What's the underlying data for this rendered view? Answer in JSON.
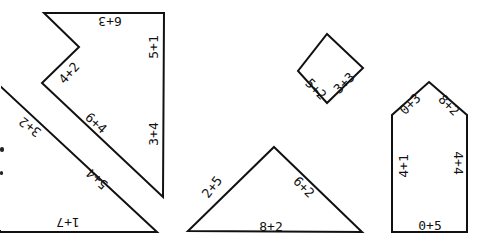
{
  "stroke_color": "#111111",
  "background": "#ffffff",
  "shapes": {
    "zigzag_pentagon": {
      "points": "44,13 164,13 163,197 42,83 79,47",
      "labels": [
        {
          "text": "6+3",
          "x": 110,
          "y": 21,
          "rotate": 180
        },
        {
          "text": "5+1",
          "x": 153,
          "y": 47,
          "rotate": -90
        },
        {
          "text": "4+2",
          "x": 69,
          "y": 73,
          "rotate": -48
        },
        {
          "text": "6+4",
          "x": 96,
          "y": 123,
          "rotate": 42
        },
        {
          "text": "3+4",
          "x": 153,
          "y": 134,
          "rotate": -90
        }
      ]
    },
    "long_triangle": {
      "points": "0,86 157,232 0,232",
      "labels": [
        {
          "text": "3+2",
          "x": 30,
          "y": 127,
          "rotate": 217
        },
        {
          "text": "5+4",
          "x": 97,
          "y": 179,
          "rotate": 222
        },
        {
          "text": "1+7",
          "x": 68,
          "y": 222,
          "rotate": 180
        }
      ]
    },
    "wide_triangle": {
      "points": "274,147 362,232 188,231",
      "labels": [
        {
          "text": "2+5",
          "x": 212,
          "y": 187,
          "rotate": -52
        },
        {
          "text": "6+2",
          "x": 304,
          "y": 187,
          "rotate": 45
        },
        {
          "text": "8+2",
          "x": 271,
          "y": 226,
          "rotate": 0
        }
      ]
    },
    "diamond": {
      "points": "327,34 363,68 327,103 298,71",
      "labels": [
        {
          "text": "5+2",
          "x": 316,
          "y": 89,
          "rotate": 45
        },
        {
          "text": "3+3",
          "x": 344,
          "y": 83,
          "rotate": -45
        }
      ]
    },
    "house_pentagon": {
      "points": "429,82 467,115 467,232 392,232 392,115",
      "labels": [
        {
          "text": "0+3",
          "x": 410,
          "y": 104,
          "rotate": -45
        },
        {
          "text": "8+2",
          "x": 449,
          "y": 105,
          "rotate": 45
        },
        {
          "text": "4+1",
          "x": 403,
          "y": 166,
          "rotate": -90
        },
        {
          "text": "4+4",
          "x": 458,
          "y": 163,
          "rotate": 90
        },
        {
          "text": "0+5",
          "x": 430,
          "y": 225,
          "rotate": 0
        }
      ]
    }
  }
}
